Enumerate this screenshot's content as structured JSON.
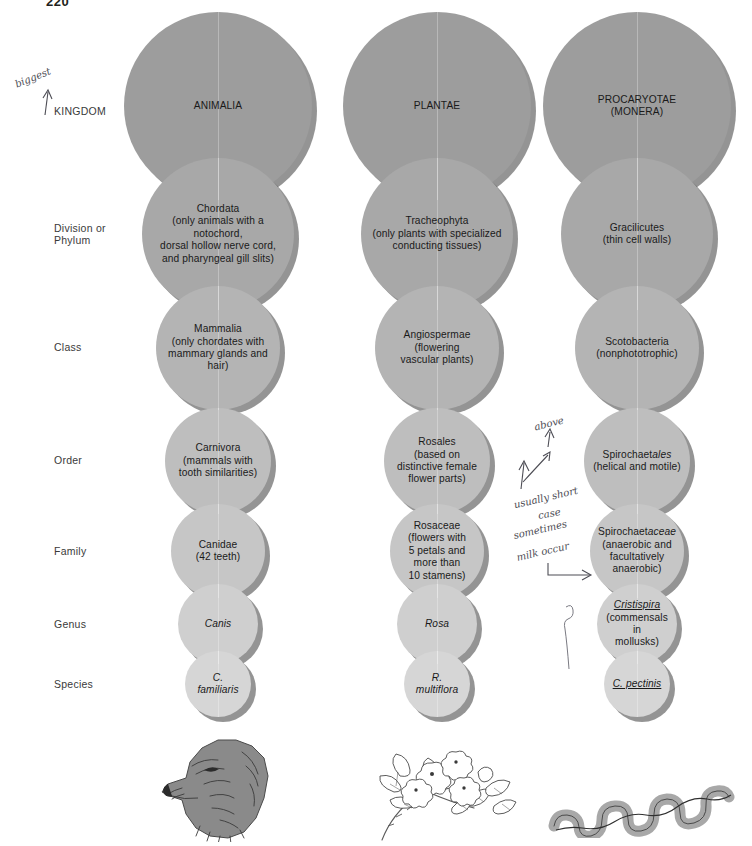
{
  "page": {
    "number": "220"
  },
  "row_labels": [
    {
      "id": "kingdom",
      "text": "KINGDOM",
      "top": 105
    },
    {
      "id": "phylum",
      "text": "Division or\nPhylum",
      "top": 222
    },
    {
      "id": "class",
      "text": "Class",
      "top": 341
    },
    {
      "id": "order",
      "text": "Order",
      "top": 454
    },
    {
      "id": "family",
      "text": "Family",
      "top": 545
    },
    {
      "id": "genus",
      "text": "Genus",
      "top": 618
    },
    {
      "id": "species",
      "text": "Species",
      "top": 678
    }
  ],
  "colors": {
    "kingdom_fill": "#9d9d9d",
    "phylum_fill": "#a8a8a8",
    "class_fill": "#b4b4b4",
    "order_fill": "#bebebe",
    "family_fill": "#c6c6c6",
    "genus_fill": "#cfcfcf",
    "species_fill": "#d6d6d6",
    "shadow": "#4a4a4a",
    "text": "#1a1a1a",
    "label": "#3a3a3a",
    "pencil": "#4d4d55"
  },
  "columns": [
    {
      "id": "animalia",
      "illustration": "dog-head-illustration",
      "ranks": [
        {
          "rank": "kingdom",
          "name": "ANIMALIA",
          "detail": ""
        },
        {
          "rank": "phylum",
          "name": "Chordata",
          "detail": "(only animals with a notochord,\ndorsal hollow nerve cord,\nand pharyngeal gill slits)"
        },
        {
          "rank": "class",
          "name": "Mammalia",
          "detail": "(only chordates with\nmammary glands and hair)"
        },
        {
          "rank": "order",
          "name": "Carnivora",
          "detail": "(mammals with\ntooth similarities)"
        },
        {
          "rank": "family",
          "name": "Canidae",
          "detail": "(42 teeth)"
        },
        {
          "rank": "genus",
          "name": "Canis",
          "detail": "",
          "style": "italic"
        },
        {
          "rank": "species",
          "name": "C. familiaris",
          "detail": "",
          "style": "italic"
        }
      ]
    },
    {
      "id": "plantae",
      "illustration": "rose-branch-illustration",
      "ranks": [
        {
          "rank": "kingdom",
          "name": "PLANTAE",
          "detail": ""
        },
        {
          "rank": "phylum",
          "name": "Tracheophyta",
          "detail": "(only plants with specialized\nconducting tissues)"
        },
        {
          "rank": "class",
          "name": "Angiospermae",
          "detail": "(flowering\nvascular plants)"
        },
        {
          "rank": "order",
          "name": "Rosales",
          "detail": "(based on\ndistinctive female\nflower parts)"
        },
        {
          "rank": "family",
          "name": "Rosaceae",
          "detail": "(flowers with\n5 petals and\nmore than\n10 stamens)"
        },
        {
          "rank": "genus",
          "name": "Rosa",
          "detail": "",
          "style": "italic"
        },
        {
          "rank": "species",
          "name": "R. multiflora",
          "detail": "",
          "style": "italic"
        }
      ]
    },
    {
      "id": "procaryotae",
      "illustration": "spirochete-illustration",
      "ranks": [
        {
          "rank": "kingdom",
          "name": "PROCARYOTAE",
          "detail": "(MONERA)"
        },
        {
          "rank": "phylum",
          "name": "Gracilicutes",
          "detail": "(thin cell walls)"
        },
        {
          "rank": "class",
          "name": "Scotobacteria",
          "detail": "(nonphototrophic)"
        },
        {
          "rank": "order",
          "name": "Spirochaetales",
          "detail": "(helical and motile)",
          "stem": "Spirochaet",
          "suffix": "ales",
          "style": "suffix-italic"
        },
        {
          "rank": "family",
          "name": "Spirochaetaceae",
          "detail": "(anaerobic and\nfacultatively\nanaerobic)",
          "stem": "Spirochaet",
          "suffix": "aceae",
          "style": "suffix-italic"
        },
        {
          "rank": "genus",
          "name": "Cristispira",
          "detail": "(commensals in\nmollusks)",
          "style": "italic-underline"
        },
        {
          "rank": "species",
          "name": "C. pectinis",
          "detail": "",
          "style": "italic-underline"
        }
      ]
    }
  ],
  "annotations": [
    {
      "id": "biggest",
      "text": "biggest",
      "left": 14,
      "top": 72,
      "rotate": -22
    },
    {
      "id": "above",
      "text": "above",
      "left": 534,
      "top": 418,
      "rotate": -14
    },
    {
      "id": "usually-short",
      "text": "usually short",
      "left": 513,
      "top": 492,
      "rotate": -13
    },
    {
      "id": "case",
      "text": "case",
      "left": 538,
      "top": 508,
      "rotate": -10
    },
    {
      "id": "sometimes",
      "text": "sometimes",
      "left": 513,
      "top": 524,
      "rotate": -13
    },
    {
      "id": "milk-occur",
      "text": "milk occur",
      "left": 516,
      "top": 546,
      "rotate": -13
    }
  ]
}
